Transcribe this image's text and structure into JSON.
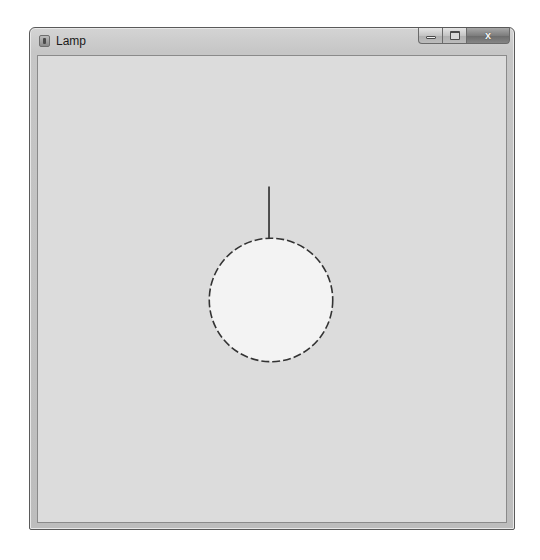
{
  "window": {
    "title": "Lamp",
    "icon": "java-app-icon",
    "buttons": {
      "minimize": "minimize",
      "maximize": "maximize",
      "close": "x"
    }
  },
  "canvas": {
    "background": "#dcdcdc",
    "lamp": {
      "cord": {
        "x": 269,
        "y1": 186,
        "y2": 239,
        "color": "#1e1e1e"
      },
      "bulb": {
        "cx": 271,
        "cy": 300,
        "r": 62,
        "fill": "#f3f3f3",
        "stroke": "#333333",
        "dash": "8,3"
      }
    }
  }
}
